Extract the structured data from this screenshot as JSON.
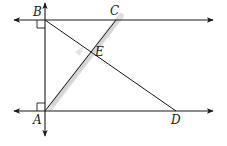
{
  "diagram": {
    "type": "geometry",
    "points": {
      "A": {
        "label": "A"
      },
      "B": {
        "label": "B"
      },
      "C": {
        "label": "C"
      },
      "D": {
        "label": "D"
      },
      "E": {
        "label": "E"
      }
    },
    "lines": [
      {
        "name": "line-through-B",
        "from": "B",
        "arrows": "both"
      },
      {
        "name": "line-through-A",
        "from": "A",
        "arrows": "both"
      },
      {
        "name": "line-AB",
        "arrows": "both"
      }
    ],
    "segments": [
      {
        "from": "B",
        "to": "D"
      },
      {
        "from": "A",
        "to": "C"
      }
    ],
    "right_angles": [
      "B",
      "A"
    ],
    "intersection": {
      "point": "E",
      "of": [
        "BD",
        "AC"
      ]
    },
    "colors": {
      "line": "#1a1a1a",
      "highlight": "#bdbdbd"
    }
  }
}
